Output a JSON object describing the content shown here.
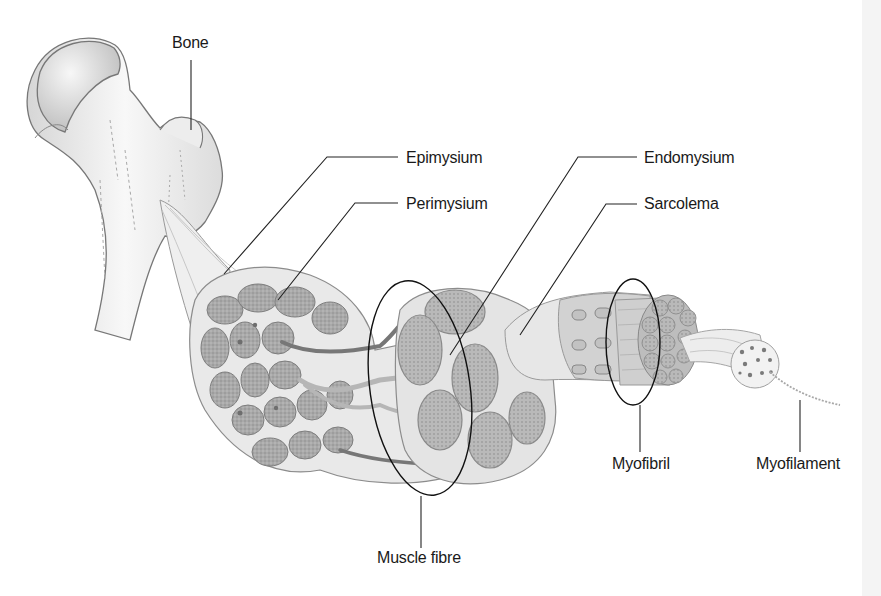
{
  "diagram": {
    "labels": {
      "bone": "Bone",
      "epimysium": "Epimysium",
      "perimysium": "Perimysium",
      "endomysium": "Endomysium",
      "sarcolema": "Sarcolema",
      "muscle_fibre": "Muscle fibre",
      "myofibril": "Myofibril",
      "myofilament": "Myofilament"
    },
    "colors": {
      "background": "#ffffff",
      "line": "#1a1a1a",
      "tissue_light": "#e6e6e6",
      "tissue_mid": "#b8b8b8",
      "tissue_dark": "#8c8c8c",
      "vessel": "#6e6e6e"
    }
  }
}
